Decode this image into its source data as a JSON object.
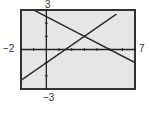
{
  "chart_data": {
    "type": "line",
    "title": "",
    "xlabel": "",
    "ylabel": "",
    "xlim": [
      -2,
      7
    ],
    "ylim": [
      -3,
      3
    ],
    "xtick_step": 1,
    "ytick_step": 1,
    "grid": false,
    "legend": null,
    "window_labels": {
      "xmin": "−2",
      "xmax": "7",
      "ymin": "−3",
      "ymax": "3"
    },
    "series": [
      {
        "name": "line-increasing",
        "equation": "y = (2/3)x - 1",
        "x": [
          -2,
          5.5
        ],
        "y": [
          -2.333,
          2.667
        ],
        "y_intercept": -1,
        "x_intercept": 1.5
      },
      {
        "name": "line-decreasing",
        "equation": "y = -0.5x + 2.5",
        "x": [
          -1,
          7
        ],
        "y": [
          3,
          -1
        ],
        "y_intercept": 2.5,
        "x_intercept": 5
      }
    ],
    "annotations": [
      {
        "type": "intersection",
        "x": 3,
        "y": 1
      }
    ]
  },
  "colors": {
    "screen_background": "#e6e6e6",
    "frame": "#333333",
    "axes": "#222222",
    "lines": "#2a2a2a",
    "labels": "#333333"
  }
}
